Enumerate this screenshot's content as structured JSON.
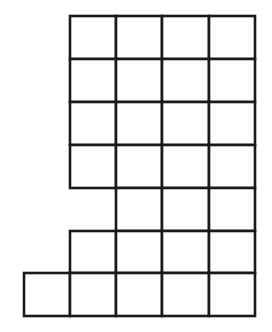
{
  "figure": {
    "background_color": "#ffffff",
    "line_color": "#1a1a1a",
    "fill_color": "#ffffff",
    "line_width": 2.6,
    "total_cells": 22
  },
  "chart_data": {
    "type": "table",
    "xlabel": "",
    "ylabel": "",
    "grid": true,
    "legend": "none",
    "cell_size_px": 46,
    "origin_px": {
      "x": 24,
      "y": 16
    },
    "column_x": [
      24,
      70,
      116,
      162,
      209,
      255
    ],
    "row_y": [
      16,
      59,
      102,
      145,
      188,
      231,
      273,
      316
    ],
    "columns": 5,
    "rows": 7,
    "occupancy": [
      [
        0,
        1,
        1,
        1,
        1
      ],
      [
        0,
        1,
        1,
        1,
        1
      ],
      [
        0,
        1,
        1,
        1,
        1
      ],
      [
        0,
        1,
        1,
        1,
        1
      ],
      [
        0,
        0,
        1,
        1,
        1
      ],
      [
        0,
        1,
        1,
        1,
        1
      ],
      [
        1,
        1,
        1,
        1,
        1
      ]
    ],
    "row_counts": [
      4,
      4,
      4,
      4,
      3,
      4,
      5
    ],
    "categories": [
      "row 1",
      "row 2",
      "row 3",
      "row 4",
      "row 5",
      "row 6",
      "row 7"
    ],
    "values": [
      4,
      4,
      4,
      4,
      3,
      4,
      5
    ]
  }
}
